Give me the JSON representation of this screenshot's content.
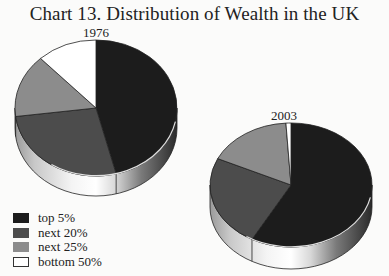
{
  "title": "Chart 13. Distribution of Wealth in the UK",
  "legend": [
    {
      "label": "top 5%",
      "color": "#1c1c1c"
    },
    {
      "label": "next 20%",
      "color": "#4c4c4c"
    },
    {
      "label": "next 25%",
      "color": "#8c8c8c"
    },
    {
      "label": "bottom 50%",
      "color": "#ffffff"
    }
  ],
  "chart_data": [
    {
      "type": "pie",
      "title": "1976",
      "categories": [
        "top 5%",
        "next 20%",
        "next 25%",
        "bottom 50%"
      ],
      "values": [
        46,
        27,
        15,
        12
      ],
      "style": "3d"
    },
    {
      "type": "pie",
      "title": "2003",
      "categories": [
        "top 5%",
        "next 20%",
        "next 25%",
        "bottom 50%"
      ],
      "values": [
        58,
        24,
        17,
        1
      ],
      "style": "3d"
    }
  ],
  "pies": {
    "p1976": {
      "year": "1976",
      "cx": 96,
      "cy": 108,
      "rx": 81,
      "ry": 68,
      "depth": 20
    },
    "p2003": {
      "year": "2003",
      "cx": 291,
      "cy": 185,
      "rx": 81,
      "ry": 62,
      "depth": 22
    }
  }
}
